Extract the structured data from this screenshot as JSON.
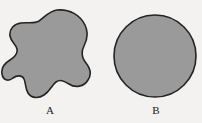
{
  "figure": {
    "background_color": "#f3f2f0",
    "width": 202,
    "height": 123,
    "caption": "",
    "shapes": [
      {
        "id": "shape-a",
        "label": "A",
        "kind": "irregular-blob",
        "description": "Irregular closed amoeba-like region with concave notches",
        "fill_color": "#9a9a9a",
        "stroke_color": "#242424",
        "stroke_width": 1.6,
        "label_x": 50,
        "label_y": 112,
        "bbox": [
          8,
          10,
          95,
          98
        ]
      },
      {
        "id": "shape-b",
        "label": "B",
        "kind": "circle",
        "description": "Convex circular region",
        "fill_color": "#9a9a9a",
        "stroke_color": "#242424",
        "stroke_width": 1.6,
        "center_x": 155,
        "center_y": 56,
        "radius": 41,
        "label_x": 156,
        "label_y": 112,
        "bbox": [
          114,
          15,
          196,
          97
        ]
      }
    ]
  }
}
